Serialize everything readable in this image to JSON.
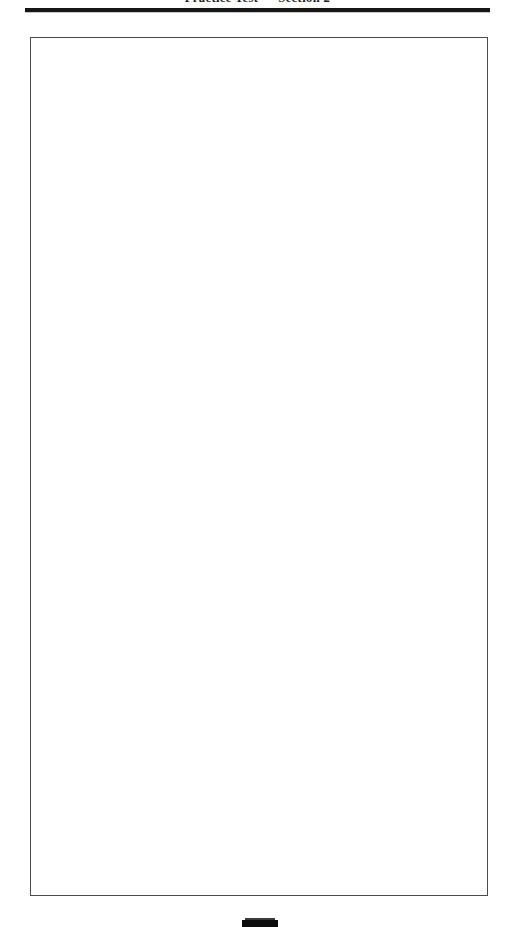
{
  "document": {
    "page_background": "#ffffff",
    "ink_color": "#161616",
    "border_color": "#4b4b4b"
  },
  "header": {
    "title": "Practice Test — Section 2",
    "rule_visible": true
  },
  "content": {
    "box_label": "empty-answer-area",
    "body_text": ""
  },
  "footer": {
    "marker_label": "page-marker"
  }
}
